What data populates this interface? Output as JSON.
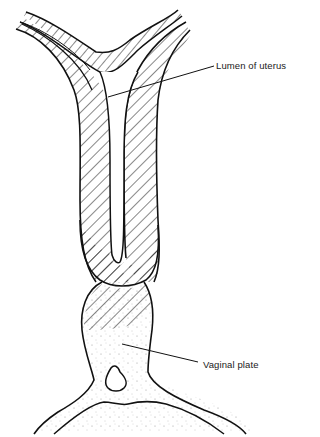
{
  "figure": {
    "type": "anatomical-line-drawing",
    "labels": [
      {
        "id": "lumen",
        "text": "Lumen of uterus"
      },
      {
        "id": "vaginal_plate",
        "text": "Vaginal plate"
      }
    ],
    "colors": {
      "stroke": "#111111",
      "background": "#ffffff",
      "stipple": "#777777"
    }
  }
}
